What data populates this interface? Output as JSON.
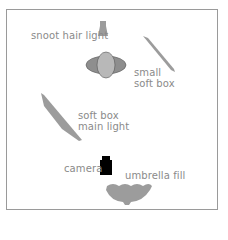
{
  "diagram": {
    "type": "lighting setup",
    "colors": {
      "frame": "#9a9a9a",
      "light_fill": "#9c9c9c",
      "subject_fill": "#b8b8b8",
      "subject_wing": "#8e8e8e",
      "camera": "#000000",
      "label": "#8a8a8a"
    },
    "labels": {
      "snoot": "snoot hair light",
      "small_softbox_line1": "small",
      "small_softbox_line2": "soft box",
      "main_softbox_line1": "soft box",
      "main_softbox_line2": "main light",
      "camera": "camera",
      "umbrella": "umbrella fill"
    }
  }
}
